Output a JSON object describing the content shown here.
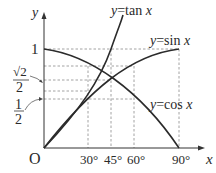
{
  "diagram": {
    "axes": {
      "x_label": "x",
      "y_label": "y",
      "origin_label": "O"
    },
    "x_ticks": [
      "30°",
      "45°",
      "60°",
      "90°"
    ],
    "y_ticks": {
      "one": "1",
      "sqrt2_over_2": {
        "num": "√2",
        "den": "2"
      },
      "half": {
        "num": "1",
        "den": "2"
      }
    },
    "curves": [
      {
        "name": "tan",
        "label_y": "y",
        "label_eq": "=tan ",
        "label_x": "x"
      },
      {
        "name": "sin",
        "label_y": "y",
        "label_eq": "=sin ",
        "label_x": "x"
      },
      {
        "name": "cos",
        "label_y": "y",
        "label_eq": "=cos ",
        "label_x": "x"
      }
    ]
  }
}
